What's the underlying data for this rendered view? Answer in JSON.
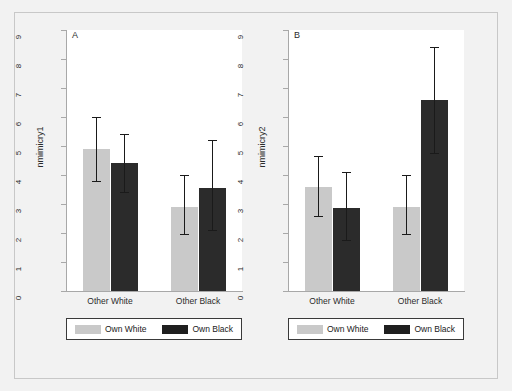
{
  "figure": {
    "background_color": "#f2f2f2",
    "plot_background_color": "#ffffff"
  },
  "colors": {
    "own_white": "#c9c9c9",
    "own_black": "#2b2b2b",
    "axis": "#a8a8a8",
    "error_bar": "#1a1a1a"
  },
  "legend": {
    "items": [
      {
        "label": "Own White",
        "swatch": "own-white"
      },
      {
        "label": "Own Black",
        "swatch": "own-black"
      }
    ]
  },
  "chart_data": [
    {
      "type": "bar",
      "panel_label": "A",
      "title": "",
      "xlabel": "",
      "ylabel": "nmimicry1",
      "ylim": [
        0,
        9
      ],
      "yticks": [
        0,
        1,
        2,
        3,
        4,
        5,
        6,
        7,
        8,
        9
      ],
      "ytick_labels": [
        "0",
        "1",
        "2",
        "3",
        "4",
        "5",
        "6",
        "7",
        "8",
        "9"
      ],
      "grid": false,
      "legend_position": "below-axes",
      "categories": [
        "Other White",
        "Other Black"
      ],
      "series": [
        {
          "name": "Own White",
          "color": "#c9c9c9",
          "values": [
            4.9,
            2.9
          ],
          "ci_low": [
            3.8,
            1.95
          ],
          "ci_high": [
            6.0,
            4.0
          ]
        },
        {
          "name": "Own Black",
          "color": "#2b2b2b",
          "values": [
            4.4,
            3.55
          ],
          "ci_low": [
            3.4,
            2.1
          ],
          "ci_high": [
            5.4,
            5.2
          ]
        }
      ]
    },
    {
      "type": "bar",
      "panel_label": "B",
      "title": "",
      "xlabel": "",
      "ylabel": "nmimicry2",
      "ylim": [
        0,
        9
      ],
      "yticks": [
        0,
        1,
        2,
        3,
        4,
        5,
        6,
        7,
        8,
        9
      ],
      "ytick_labels": [
        "0",
        "1",
        "2",
        "3",
        "4",
        "5",
        "6",
        "7",
        "8",
        "9"
      ],
      "grid": false,
      "legend_position": "below-axes",
      "categories": [
        "Other White",
        "Other Black"
      ],
      "series": [
        {
          "name": "Own White",
          "color": "#c9c9c9",
          "values": [
            3.6,
            2.9
          ],
          "ci_low": [
            2.6,
            1.95
          ],
          "ci_high": [
            4.65,
            4.0
          ]
        },
        {
          "name": "Own Black",
          "color": "#2b2b2b",
          "values": [
            2.85,
            6.6
          ],
          "ci_low": [
            1.75,
            4.75
          ],
          "ci_high": [
            4.1,
            8.4
          ]
        }
      ]
    }
  ]
}
